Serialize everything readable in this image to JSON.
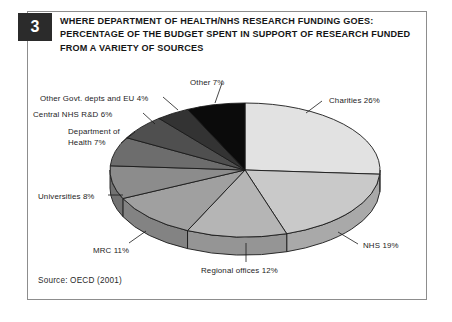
{
  "figure": {
    "number": "3",
    "title_lines": [
      "WHERE DEPARTMENT OF HEALTH/NHS RESEARCH FUNDING GOES:",
      "PERCENTAGE OF THE BUDGET SPENT IN SUPPORT OF RESEARCH FUNDED",
      "FROM A VARIETY OF SOURCES"
    ],
    "source": "Source: OECD (2001)"
  },
  "chart_data": {
    "type": "pie",
    "title": "WHERE DEPARTMENT OF HEALTH/NHS RESEARCH FUNDING GOES: PERCENTAGE OF THE BUDGET SPENT IN SUPPORT OF RESEARCH FUNDED FROM A VARIETY OF SOURCES",
    "xlabel": "",
    "ylabel": "",
    "unit": "%",
    "total": 100,
    "legend_position": "outside-callouts",
    "grid": false,
    "three_d": true,
    "start_angle_deg": 0,
    "direction": "clockwise",
    "categories": [
      "Charities",
      "NHS",
      "Regional offices",
      "MRC",
      "Universities",
      "Department of Health",
      "Central NHS R&D",
      "Other Govt. depts and EU",
      "Other"
    ],
    "values": [
      26,
      19,
      12,
      11,
      8,
      7,
      6,
      4,
      7
    ],
    "slices": [
      {
        "label": "Charities",
        "value": 26,
        "text": "Charities",
        "pct": "26%",
        "color": "#e2e2e2",
        "side_color": "#c2c2c2"
      },
      {
        "label": "NHS",
        "value": 19,
        "text": "NHS",
        "pct": "19%",
        "color": "#c9c9c9",
        "side_color": "#a9a9a9"
      },
      {
        "label": "Regional offices",
        "value": 12,
        "text": "Regional offices",
        "pct": "12%",
        "color": "#b5b5b5",
        "side_color": "#959595"
      },
      {
        "label": "MRC",
        "value": 11,
        "text": "MRC",
        "pct": "11%",
        "color": "#a0a0a0",
        "side_color": "#838383"
      },
      {
        "label": "Universities",
        "value": 8,
        "text": "Universities",
        "pct": "8%",
        "color": "#8c8c8c",
        "side_color": "#727272"
      },
      {
        "label": "Department of Health",
        "value": 7,
        "text": "Department of",
        "pct": "7%",
        "color": "#6d6d6d",
        "side_color": "#585858",
        "text2": "Health"
      },
      {
        "label": "Central NHS R&D",
        "value": 6,
        "text": "Central NHS R&D",
        "pct": "6%",
        "color": "#4f4f4f",
        "side_color": "#3f3f3f"
      },
      {
        "label": "Other Govt. depts and EU",
        "value": 4,
        "text": "Other Govt. depts and EU",
        "pct": "4%",
        "color": "#333333",
        "side_color": "#282828"
      },
      {
        "label": "Other",
        "value": 7,
        "text": "Other",
        "pct": "7%",
        "color": "#0b0b0b",
        "side_color": "#080808"
      }
    ]
  },
  "colors": {
    "frame_border": "#8d8d8d",
    "badge_bg": "#2b2b2b",
    "text": "#1a1a1a",
    "outline": "#1a1a1a",
    "background": "#ffffff"
  }
}
